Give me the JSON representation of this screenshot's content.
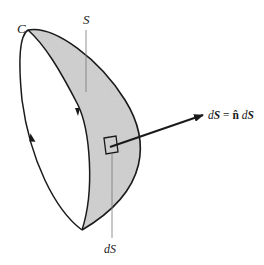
{
  "figure": {
    "type": "surface-integral-diagram",
    "labels": {
      "boundary_curve": "C",
      "surface": "S",
      "area_element": "dS",
      "vector_element_lhs_d": "d",
      "vector_element_lhs_S": "S",
      "equals": " = ",
      "normal": "n̂",
      "vector_element_rhs_d": " d",
      "vector_element_rhs_S": "S"
    },
    "colors": {
      "stroke": "#1a1a1a",
      "surface_fill": "#cfcfcf",
      "leader_line": "#777777",
      "background": "#ffffff"
    }
  }
}
